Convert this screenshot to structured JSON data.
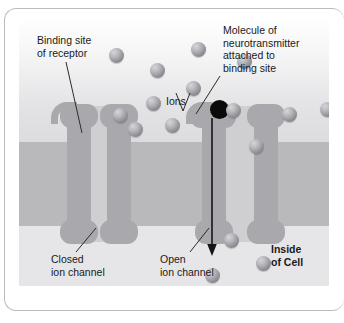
{
  "figure": {
    "clipped_top_caption": "",
    "labels": {
      "binding_site": "Binding site\nof receptor",
      "molecule": "Molecule of\nneurotransmitter\nattached to\nbinding site",
      "ions": "Ions",
      "closed_channel": "Closed\nion channel",
      "open_channel": "Open\nion channel",
      "inside_of_cell": "Inside\nof Cell"
    },
    "colors": {
      "membrane": "#b9b9bc",
      "extracellular_fluid": "#eeeef0",
      "intracellular_fluid": "#e6e6e8",
      "channel_protein": "#a9a9ad",
      "channel_pore": "#cfcfd2",
      "ion": "#8f8f96",
      "neurotransmitter": "#0a0a0a",
      "leader_line": "#2b2b2b",
      "frame_border": "#b9bbbe"
    },
    "structures": [
      {
        "name": "closed-ion-channel",
        "state": "closed",
        "pore_width_px": 16
      },
      {
        "name": "open-ion-channel",
        "state": "open",
        "pore_width_px": 28
      }
    ],
    "flow_arrow": {
      "direction": "downward",
      "meaning": "ions moving into cell"
    },
    "ions_outside": [
      {
        "x": 90,
        "y": 30
      },
      {
        "x": 172,
        "y": 24
      },
      {
        "x": 131,
        "y": 45
      },
      {
        "x": 218,
        "y": 36
      },
      {
        "x": 167,
        "y": 63
      },
      {
        "x": 127,
        "y": 78
      },
      {
        "x": 94,
        "y": 90
      },
      {
        "x": 146,
        "y": 100
      },
      {
        "x": 109,
        "y": 104
      },
      {
        "x": 263,
        "y": 89
      },
      {
        "x": 301,
        "y": 84
      },
      {
        "x": 230,
        "y": 121
      },
      {
        "x": 207,
        "y": 125
      }
    ],
    "ions_inside": [
      {
        "x": 205,
        "y": 232
      },
      {
        "x": 189,
        "y": 270
      },
      {
        "x": 240,
        "y": 258
      }
    ]
  }
}
